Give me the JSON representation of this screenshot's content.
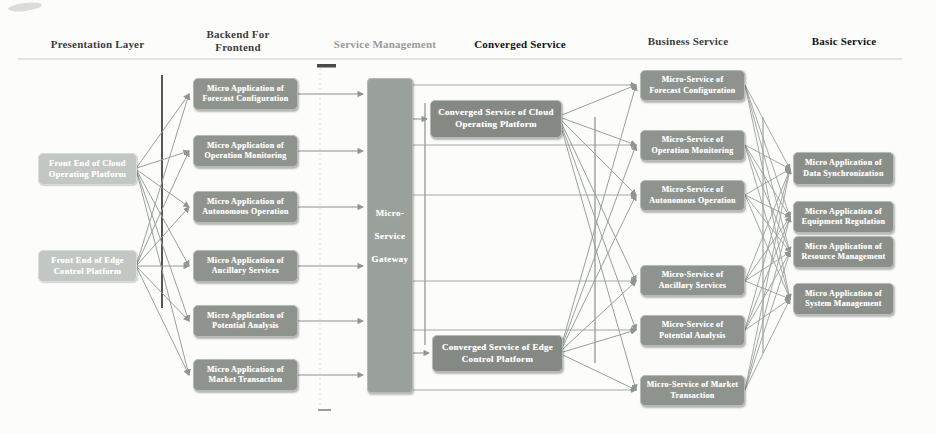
{
  "headers": {
    "presentation": "Presentation Layer",
    "backend": "Backend For Frontend",
    "service_management": "Service Management",
    "converged": "Converged Service",
    "business": "Business Service",
    "basic": "Basic Service"
  },
  "presentation_nodes": {
    "cloud": "Front End of Cloud Operating Platform",
    "edge": "Front End of Edge Control Platform"
  },
  "backend_nodes": [
    "Micro Application of Forecast Configuration",
    "Micro Application of Operation Monitoring",
    "Micro Application of Autonomous Operation",
    "Micro Application of Ancillary Services",
    "Micro Application of Potential Analysis",
    "Micro Application of Market Transaction"
  ],
  "gateway": {
    "line1": "Micro-",
    "line2": "Service",
    "line3": "Gateway"
  },
  "converged_nodes": [
    "Converged Service of Cloud Operating Platform",
    "Converged Service of  Edge Control Platform"
  ],
  "business_nodes": [
    "Micro-Service of Forecast Configuration",
    "Micro-Service of Operation Monitoring",
    "Micro-Service of Autonomous Operation",
    "Micro-Service of Ancillary Services",
    "Micro-Service of Potential Analysis",
    "Micro-Service of Market Transaction"
  ],
  "basic_nodes": [
    "Micro Application of Data Synchronization",
    "Micro Application of Equipment Regulation",
    "Micro Application of Resource Management",
    "Micro Application of System Management"
  ],
  "colors": {
    "node_fill": "#8e938e",
    "node_light_fill": "#c3c7c3",
    "converged_fill": "#848984",
    "gateway_fill": "#9aa09a",
    "connector": "#98a098",
    "dark_rule": "#434343",
    "header_text": "#3d3d3d",
    "header_text_light": "#9a9a9a",
    "node_text": "#ffffff"
  }
}
